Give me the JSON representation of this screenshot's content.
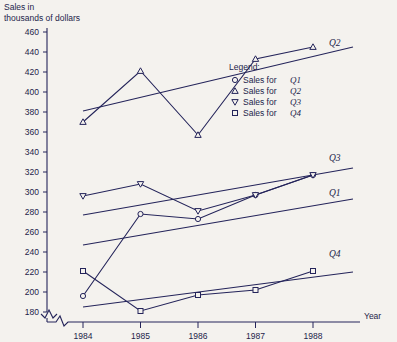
{
  "chart_data": {
    "type": "line",
    "title": "",
    "ylabel": "Sales in thousands of dollars",
    "xlabel": "Year",
    "categories": [
      "1984",
      "1985",
      "1986",
      "1987",
      "1988"
    ],
    "ylim": [
      180,
      460
    ],
    "ytick_step": 20,
    "yticks": [
      "180",
      "200",
      "220",
      "240",
      "260",
      "280",
      "300",
      "320",
      "340",
      "360",
      "380",
      "400",
      "420",
      "440",
      "460"
    ],
    "grid": false,
    "axis_break": true,
    "legend_position": "right",
    "legend_title": "Legend:",
    "series": [
      {
        "name": "Q1",
        "marker": "circle",
        "legend": "Sales for Q1",
        "end_label": "Q1",
        "values": [
          196,
          278,
          273,
          297,
          317
        ],
        "trend": [
          185,
          220
        ]
      },
      {
        "name": "Q2",
        "marker": "triangle-up",
        "legend": "Sales for Q2",
        "end_label": "Q2",
        "values": [
          370,
          421,
          357,
          433,
          445
        ],
        "trend": [
          381,
          445
        ]
      },
      {
        "name": "Q3",
        "marker": "triangle-down",
        "legend": "Sales for Q3",
        "end_label": "Q3",
        "values": [
          296,
          308,
          281,
          297,
          317
        ],
        "trend": [
          277,
          324
        ]
      },
      {
        "name": "Q4",
        "marker": "square",
        "legend": "Sales for Q4",
        "end_label": "Q4",
        "values": [
          221,
          181,
          197,
          202,
          221
        ],
        "trend": [
          247,
          293
        ]
      }
    ]
  },
  "legend": {
    "title": "Legend:",
    "items": [
      {
        "marker": "circle",
        "prefix": "Sales for",
        "series": "Q1"
      },
      {
        "marker": "triangle-up",
        "prefix": "Sales for",
        "series": "Q2"
      },
      {
        "marker": "triangle-down",
        "prefix": "Sales for",
        "series": "Q3"
      },
      {
        "marker": "square",
        "prefix": "Sales for",
        "series": "Q4"
      }
    ]
  },
  "axes": {
    "y_title_line1": "Sales in",
    "y_title_line2": "thousands of dollars",
    "x_title": "Year"
  }
}
